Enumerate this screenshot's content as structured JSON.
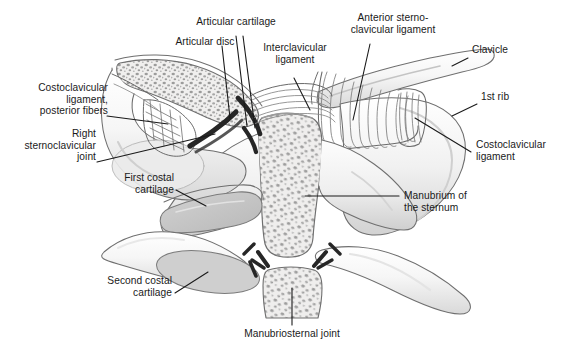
{
  "figure": {
    "line_color": "#1a1a1a",
    "text_color": "#1a1a1a",
    "background": "#ffffff",
    "bone_outline": "#6e6e6e",
    "trabecular_bone": "#8a8a8a",
    "cartilage_dark": "#2b2b2b",
    "cartilage_fill": "#c9c9c9",
    "bone_fill": "#f2f2f2",
    "shadow_gray": "#d8d8d8"
  },
  "labels": [
    {
      "id": "articular-cartilage",
      "text": "Articular cartilage",
      "align": "center"
    },
    {
      "id": "articular-disc",
      "text": "Articular disc",
      "align": "center"
    },
    {
      "id": "interclavicular-ligament",
      "text": "Interclavicular\nligament",
      "align": "center"
    },
    {
      "id": "anterior-sternoclavicular-ligament",
      "text": "Anterior sterno-\nclavicular ligament",
      "align": "center"
    },
    {
      "id": "clavicle",
      "text": "Clavicle",
      "align": "left"
    },
    {
      "id": "first-rib",
      "text": "1st rib",
      "align": "left"
    },
    {
      "id": "costoclavicular-ligament",
      "text": "Costoclavicular\nligament",
      "align": "left"
    },
    {
      "id": "costoclavicular-ligament-posterior-fibers",
      "text": "Costoclavicular\nligament,\nposterior fibers",
      "align": "right"
    },
    {
      "id": "right-sternoclavicular-joint",
      "text": "Right\nsternoclavicular\njoint",
      "align": "right"
    },
    {
      "id": "first-costal-cartilage",
      "text": "First costal\ncartilage",
      "align": "right"
    },
    {
      "id": "second-costal-cartilage",
      "text": "Second costal\ncartilage",
      "align": "right"
    },
    {
      "id": "manubrium-of-the-sternum",
      "text": "Manubrium of\nthe sternum",
      "align": "left"
    },
    {
      "id": "manubriosternal-joint",
      "text": "Manubriosternal joint",
      "align": "center"
    }
  ],
  "structures": [
    {
      "id": "clavicle-left-cut",
      "name": "left clavicle, cut in coronal section"
    },
    {
      "id": "clavicle-right",
      "name": "right clavicle, surface view"
    },
    {
      "id": "manubrium",
      "name": "manubrium of the sternum, cut"
    },
    {
      "id": "sternum-body",
      "name": "body of sternum, cut"
    },
    {
      "id": "first-costal-cartilage",
      "name": "first costal cartilage"
    },
    {
      "id": "second-costal-cartilage",
      "name": "second costal cartilage"
    },
    {
      "id": "first-rib-right",
      "name": "right first rib"
    },
    {
      "id": "articular-disc",
      "name": "articular disc of sternoclavicular joint"
    },
    {
      "id": "interclavicular-lig",
      "name": "interclavicular ligament fibers"
    },
    {
      "id": "anterior-sc-lig",
      "name": "anterior sternoclavicular ligament fibers"
    },
    {
      "id": "costoclavicular-lig",
      "name": "costoclavicular ligament fibers"
    },
    {
      "id": "manubriosternal-joint",
      "name": "manubriosternal joint cartilage"
    }
  ]
}
